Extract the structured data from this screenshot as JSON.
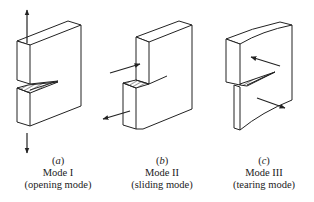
{
  "figure": {
    "type": "fracture-modes-diagram",
    "panels": [
      {
        "id": "a",
        "letter": "a",
        "mode": "Mode I",
        "description": "(opening mode)",
        "arrows": [
          "up",
          "down"
        ]
      },
      {
        "id": "b",
        "letter": "b",
        "mode": "Mode II",
        "description": "(sliding mode)",
        "arrows": [
          "in-plane-right",
          "in-plane-left"
        ]
      },
      {
        "id": "c",
        "letter": "c",
        "mode": "Mode III",
        "description": "(tearing mode)",
        "arrows": [
          "out-of-plane-upper-left",
          "out-of-plane-lower-right"
        ]
      }
    ],
    "stroke_color": "#222222",
    "background": "#ffffff"
  }
}
